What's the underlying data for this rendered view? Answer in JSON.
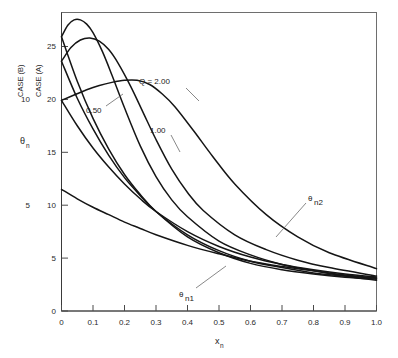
{
  "figure": {
    "background": "#ffffff",
    "curve_color": "#151515",
    "axis_color": "#3a3a3a",
    "frame_color": "#6e6e6e"
  },
  "axes": {
    "x": {
      "label": "x",
      "label_sub": "n",
      "ticks": [
        "0",
        "0.1",
        "0.2",
        "0.3",
        "0.4",
        "0.5",
        "0.6",
        "0.7",
        "0.8",
        "0.9",
        "1.0"
      ],
      "min": 0,
      "max": 1.0
    },
    "y_primary": {
      "caption": "CASE (A)",
      "label": "θ",
      "label_sub": "n",
      "ticks": [
        "0",
        "5",
        "10",
        "15",
        "20",
        "25"
      ],
      "min": 0,
      "max": 28.2
    },
    "y_secondary": {
      "caption": "CASE (B)",
      "ticks": [
        "5",
        "10"
      ]
    }
  },
  "annotations": [
    {
      "name": "q-2-00",
      "text": "Q = 2.00"
    },
    {
      "name": "q-0-50",
      "text": "0.50"
    },
    {
      "name": "q-1-00",
      "text": "1.00"
    },
    {
      "name": "theta-n2",
      "text": "θ",
      "sub": "n2"
    },
    {
      "name": "theta-n1",
      "text": "θ",
      "sub": "n1"
    }
  ],
  "chart_data": {
    "type": "line",
    "title": "",
    "xlabel": "x_n",
    "ylabel": "θ_n",
    "xlim": [
      0,
      1.0
    ],
    "ylim": [
      0,
      28.2
    ],
    "grid": false,
    "legend": "inline-annotations",
    "x_ticks": [
      0,
      0.1,
      0.2,
      0.3,
      0.4,
      0.5,
      0.6,
      0.7,
      0.8,
      0.9,
      1.0
    ],
    "y_ticks": [
      0,
      5,
      10,
      15,
      20,
      25
    ],
    "secondary_y_note": "CASE (B) axis offset: 5 aligns with CASE (A) 10; 10 aligns with CASE (A) 20",
    "parameter_name": "Q",
    "parameter_values": [
      0.5,
      1.0,
      2.0
    ],
    "series": [
      {
        "name": "theta_n2 (Q = 0.50)",
        "family": "theta_n2",
        "Q": 0.5,
        "x": [
          0.0,
          0.02,
          0.04,
          0.06,
          0.08,
          0.1,
          0.13,
          0.16,
          0.2,
          0.25,
          0.3,
          0.35,
          0.4,
          0.5,
          0.6,
          0.7,
          0.8,
          0.9,
          1.0
        ],
        "y": [
          25.9,
          27.0,
          27.5,
          27.5,
          27.1,
          26.3,
          24.5,
          22.3,
          19.2,
          15.6,
          12.7,
          10.5,
          8.9,
          6.6,
          5.3,
          4.4,
          3.8,
          3.3,
          2.9
        ]
      },
      {
        "name": "theta_n2 (Q = 1.00)",
        "family": "theta_n2",
        "Q": 1.0,
        "x": [
          0.0,
          0.03,
          0.06,
          0.09,
          0.12,
          0.15,
          0.18,
          0.22,
          0.26,
          0.3,
          0.35,
          0.4,
          0.45,
          0.55,
          0.65,
          0.75,
          0.85,
          1.0
        ],
        "y": [
          23.6,
          24.9,
          25.6,
          25.8,
          25.5,
          24.7,
          23.4,
          21.2,
          18.7,
          16.2,
          13.4,
          11.2,
          9.5,
          7.2,
          5.8,
          4.8,
          4.1,
          3.3
        ]
      },
      {
        "name": "theta_n2 (Q = 2.00)",
        "family": "theta_n2",
        "Q": 2.0,
        "x": [
          0.0,
          0.04,
          0.08,
          0.12,
          0.16,
          0.2,
          0.24,
          0.28,
          0.32,
          0.36,
          0.42,
          0.48,
          0.55,
          0.65,
          0.75,
          0.85,
          1.0
        ],
        "y": [
          19.9,
          20.4,
          20.9,
          21.3,
          21.6,
          21.8,
          21.8,
          21.4,
          20.5,
          19.3,
          17.0,
          14.6,
          12.0,
          9.1,
          7.0,
          5.5,
          4.0
        ]
      },
      {
        "name": "theta_n1 (Q = 0.50)",
        "family": "theta_n1",
        "Q": 0.5,
        "x": [
          0.0,
          0.05,
          0.1,
          0.15,
          0.2,
          0.25,
          0.3,
          0.4,
          0.5,
          0.6,
          0.7,
          0.8,
          0.9,
          1.0
        ],
        "y": [
          25.9,
          21.7,
          18.2,
          15.3,
          12.9,
          11.0,
          9.4,
          7.0,
          5.5,
          4.5,
          3.9,
          3.5,
          3.2,
          3.0
        ]
      },
      {
        "name": "theta_n1 (Q = 1.00)",
        "family": "theta_n1",
        "Q": 1.0,
        "x": [
          0.0,
          0.05,
          0.1,
          0.15,
          0.2,
          0.25,
          0.3,
          0.4,
          0.5,
          0.6,
          0.7,
          0.8,
          0.9,
          1.0
        ],
        "y": [
          23.6,
          20.1,
          17.2,
          14.7,
          12.6,
          10.9,
          9.4,
          7.2,
          5.7,
          4.7,
          4.1,
          3.6,
          3.3,
          3.1
        ]
      },
      {
        "name": "theta_n1 (Q = 2.00)",
        "family": "theta_n1",
        "Q": 2.0,
        "x": [
          0.0,
          0.05,
          0.1,
          0.15,
          0.2,
          0.25,
          0.3,
          0.4,
          0.5,
          0.6,
          0.7,
          0.8,
          0.9,
          1.0
        ],
        "y": [
          19.9,
          17.5,
          15.4,
          13.6,
          12.0,
          10.6,
          9.4,
          7.5,
          6.1,
          5.1,
          4.4,
          3.9,
          3.5,
          3.2
        ]
      },
      {
        "name": "theta_n1 (lower branch)",
        "family": "theta_n1",
        "Q": null,
        "x": [
          0.0,
          0.05,
          0.1,
          0.15,
          0.2,
          0.25,
          0.3,
          0.4,
          0.5,
          0.6,
          0.7,
          0.8,
          0.9,
          1.0
        ],
        "y": [
          11.5,
          10.6,
          9.8,
          9.1,
          8.4,
          7.8,
          7.2,
          6.2,
          5.4,
          4.7,
          4.2,
          3.8,
          3.4,
          3.1
        ]
      }
    ]
  }
}
